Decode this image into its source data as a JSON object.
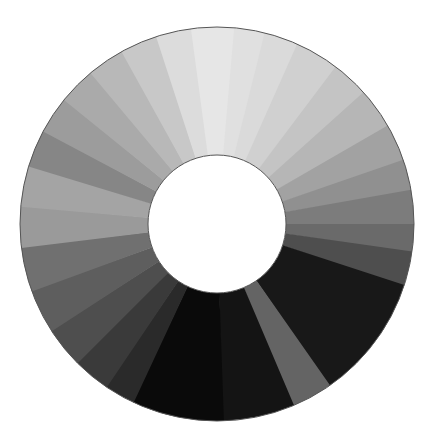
{
  "figure": {
    "center": [
      217,
      224
    ],
    "outer_radius": 197,
    "inner_radius": 69,
    "outline_color": "#555555",
    "hole_color": "#ffffff",
    "wedges": [
      {
        "start": -8,
        "end": 5,
        "color": "#e6e6e6"
      },
      {
        "start": 5,
        "end": 14,
        "color": "#e0e0e0"
      },
      {
        "start": 14,
        "end": 24,
        "color": "#dadada"
      },
      {
        "start": 24,
        "end": 37,
        "color": "#d0d0d0"
      },
      {
        "start": 37,
        "end": 48,
        "color": "#c4c4c4"
      },
      {
        "start": 48,
        "end": 60,
        "color": "#b6b6b6"
      },
      {
        "start": 60,
        "end": 71,
        "color": "#a2a2a2"
      },
      {
        "start": 71,
        "end": 80,
        "color": "#909090"
      },
      {
        "start": 80,
        "end": 90,
        "color": "#7c7c7c"
      },
      {
        "start": 90,
        "end": 98,
        "color": "#6a6a6a"
      },
      {
        "start": 98,
        "end": 108,
        "color": "#4e4e4e"
      },
      {
        "start": 108,
        "end": 145,
        "color": "#181818"
      },
      {
        "start": 145,
        "end": 157,
        "color": "#646464"
      },
      {
        "start": 157,
        "end": 178,
        "color": "#141414"
      },
      {
        "start": 178,
        "end": 205,
        "color": "#0a0a0a"
      },
      {
        "start": 205,
        "end": 214,
        "color": "#2a2a2a"
      },
      {
        "start": 214,
        "end": 225,
        "color": "#3a3a3a"
      },
      {
        "start": 225,
        "end": 237,
        "color": "#4e4e4e"
      },
      {
        "start": 237,
        "end": 250,
        "color": "#5e5e5e"
      },
      {
        "start": 250,
        "end": 263,
        "color": "#707070"
      },
      {
        "start": 263,
        "end": 275,
        "color": "#9a9a9a"
      },
      {
        "start": 275,
        "end": 287,
        "color": "#a4a4a4"
      },
      {
        "start": 287,
        "end": 298,
        "color": "#868686"
      },
      {
        "start": 298,
        "end": 309,
        "color": "#9c9c9c"
      },
      {
        "start": 309,
        "end": 320,
        "color": "#aaaaaa"
      },
      {
        "start": 320,
        "end": 331,
        "color": "#b8b8b8"
      },
      {
        "start": 331,
        "end": 342,
        "color": "#c8c8c8"
      },
      {
        "start": 342,
        "end": 352,
        "color": "#dcdcdc"
      }
    ]
  }
}
